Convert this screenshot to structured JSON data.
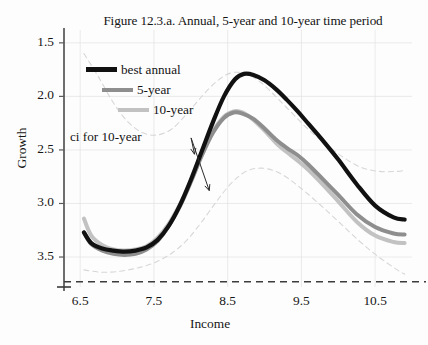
{
  "figure": {
    "title": "Figure 12.3.a. Annual, 5-year and 10-year time period",
    "annotation": "ci for 10-year",
    "background_color": "#fdfdfd",
    "grid_color": "#e3e3e3"
  },
  "axes": {
    "y_title": "Growth",
    "x_title": "Income",
    "y_ticks": [
      "3.5",
      "3.0",
      "2.5",
      "2.0",
      "1.5"
    ],
    "x_ticks": [
      "6.5",
      "7.5",
      "8.5",
      "9.5",
      "10.5"
    ]
  },
  "legend": {
    "items": [
      {
        "label": "best annual",
        "color": "#111111",
        "width": 4.2
      },
      {
        "label": "5-year",
        "color": "#8e8e8e",
        "width": 4.0
      },
      {
        "label": "10-year",
        "color": "#c2c2c2",
        "width": 4.0
      }
    ]
  },
  "chart_data": {
    "type": "line",
    "title": "Figure 12.3.a. Annual, 5-year and 10-year time period",
    "xlabel": "Income",
    "ylabel": "Growth",
    "xlim": [
      6.28,
      11.0
    ],
    "ylim": [
      1.22,
      3.62
    ],
    "yticks": [
      1.5,
      2.0,
      2.5,
      3.0,
      3.5
    ],
    "xticks": [
      6.5,
      7.5,
      8.5,
      9.5,
      10.5
    ],
    "grid": true,
    "legend_position": "upper-left",
    "annotations": [
      {
        "text": "ci for 10-year",
        "x": 7.0,
        "y": 2.64,
        "points_to": [
          [
            8.05,
            2.46
          ],
          [
            8.25,
            2.12
          ]
        ]
      }
    ],
    "baseline_dashed_y": 1.27,
    "series": [
      {
        "name": "best annual",
        "color": "#111111",
        "linewidth": 4.2,
        "x": [
          6.55,
          6.65,
          6.8,
          6.95,
          7.1,
          7.25,
          7.4,
          7.55,
          7.7,
          7.85,
          8.0,
          8.15,
          8.3,
          8.45,
          8.6,
          8.72,
          8.85,
          9.0,
          9.15,
          9.3,
          9.45,
          9.6,
          9.8,
          10.0,
          10.25,
          10.5,
          10.75,
          10.9
        ],
        "values": [
          1.73,
          1.63,
          1.58,
          1.56,
          1.55,
          1.56,
          1.59,
          1.66,
          1.79,
          1.98,
          2.22,
          2.49,
          2.76,
          3.0,
          3.16,
          3.21,
          3.2,
          3.15,
          3.07,
          2.97,
          2.86,
          2.74,
          2.58,
          2.41,
          2.18,
          1.98,
          1.87,
          1.85
        ]
      },
      {
        "name": "5-year",
        "color": "#8e8e8e",
        "linewidth": 4.0,
        "x": [
          6.55,
          6.65,
          6.8,
          6.95,
          7.1,
          7.25,
          7.4,
          7.55,
          7.7,
          7.85,
          8.0,
          8.15,
          8.3,
          8.45,
          8.58,
          8.7,
          8.85,
          9.0,
          9.15,
          9.3,
          9.45,
          9.6,
          9.8,
          10.0,
          10.25,
          10.5,
          10.75,
          10.9
        ],
        "values": [
          1.73,
          1.62,
          1.56,
          1.53,
          1.52,
          1.53,
          1.57,
          1.65,
          1.79,
          1.97,
          2.2,
          2.45,
          2.66,
          2.8,
          2.85,
          2.84,
          2.79,
          2.7,
          2.6,
          2.52,
          2.45,
          2.36,
          2.22,
          2.08,
          1.9,
          1.78,
          1.72,
          1.71
        ]
      },
      {
        "name": "10-year",
        "color": "#c2c2c2",
        "linewidth": 4.0,
        "x": [
          6.55,
          6.65,
          6.8,
          6.95,
          7.1,
          7.25,
          7.4,
          7.55,
          7.7,
          7.85,
          8.0,
          8.15,
          8.3,
          8.45,
          8.58,
          8.7,
          8.85,
          9.0,
          9.15,
          9.3,
          9.45,
          9.6,
          9.8,
          10.0,
          10.25,
          10.5,
          10.75,
          10.9
        ],
        "values": [
          1.86,
          1.7,
          1.61,
          1.57,
          1.56,
          1.57,
          1.6,
          1.68,
          1.81,
          1.99,
          2.21,
          2.45,
          2.67,
          2.81,
          2.86,
          2.85,
          2.78,
          2.68,
          2.57,
          2.48,
          2.4,
          2.31,
          2.17,
          2.02,
          1.83,
          1.7,
          1.64,
          1.63
        ]
      },
      {
        "name": "ci upper for 10-year",
        "color": "#d8d6d8",
        "linewidth": 1.1,
        "dashed": true,
        "x": [
          6.55,
          6.75,
          6.95,
          7.15,
          7.35,
          7.55,
          7.75,
          7.95,
          8.15,
          8.35,
          8.55,
          8.75,
          8.95,
          9.15,
          9.35,
          9.55,
          9.8,
          10.05,
          10.3,
          10.55,
          10.8,
          10.9
        ],
        "values": [
          3.4,
          3.18,
          2.94,
          2.76,
          2.66,
          2.64,
          2.7,
          2.84,
          3.0,
          3.14,
          3.22,
          3.21,
          3.13,
          3.0,
          2.86,
          2.72,
          2.57,
          2.44,
          2.34,
          2.3,
          2.3,
          2.31
        ]
      },
      {
        "name": "ci lower for 10-year",
        "color": "#d8d6d8",
        "linewidth": 1.1,
        "dashed": true,
        "x": [
          6.55,
          6.75,
          6.95,
          7.15,
          7.35,
          7.55,
          7.75,
          7.95,
          8.15,
          8.35,
          8.55,
          8.75,
          8.95,
          9.15,
          9.35,
          9.55,
          9.8,
          10.05,
          10.3,
          10.55,
          10.8,
          10.9
        ],
        "values": [
          1.38,
          1.36,
          1.36,
          1.38,
          1.41,
          1.46,
          1.54,
          1.66,
          1.83,
          2.02,
          2.19,
          2.3,
          2.33,
          2.3,
          2.22,
          2.11,
          1.96,
          1.8,
          1.64,
          1.5,
          1.38,
          1.34
        ]
      }
    ]
  }
}
